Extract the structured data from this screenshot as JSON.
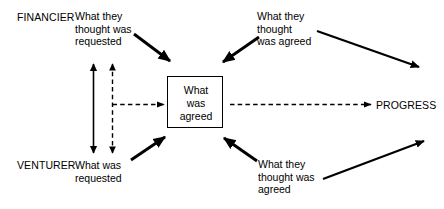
{
  "diagram": {
    "background_color": "#ffffff",
    "stroke_color": "#000000",
    "width": 444,
    "height": 209,
    "roles": {
      "top": "FINANCIER",
      "bottom": "VENTURER"
    },
    "labels": {
      "financier_requested": "What they\nthought was\nrequested",
      "financier_agreed": "What they\nthought\nwas agreed",
      "venturer_requested": "What was\nrequested",
      "venturer_agreed": "What they\nthought was\nagreed",
      "progress": "PROGRESS"
    },
    "center_box": {
      "text": "What\nwas\nagreed",
      "line1": "What",
      "line2": "was",
      "line3": "agreed"
    },
    "connectors": [
      {
        "name": "financier-requested-to-box",
        "style": "solid",
        "direction": "down-right",
        "from": "What they thought was requested",
        "to": "What was agreed"
      },
      {
        "name": "financier-agreed-from-box",
        "style": "solid",
        "direction": "down-left",
        "from": "What they thought was agreed",
        "to": "What was agreed"
      },
      {
        "name": "financier-agreed-to-progress",
        "style": "solid",
        "direction": "down-right",
        "from": "What they thought was agreed",
        "to": "PROGRESS"
      },
      {
        "name": "venturer-requested-to-box",
        "style": "solid",
        "direction": "up-right",
        "from": "What was requested",
        "to": "What was agreed"
      },
      {
        "name": "venturer-agreed-from-box",
        "style": "solid",
        "direction": "up-left",
        "from": "What they thought was agreed",
        "to": "What was agreed"
      },
      {
        "name": "venturer-agreed-to-progress",
        "style": "solid",
        "direction": "up-right",
        "from": "What they thought was agreed",
        "to": "PROGRESS"
      },
      {
        "name": "gap-solid-vertical",
        "style": "solid",
        "direction": "double-headed vertical",
        "from": "FINANCIER side",
        "to": "VENTURER side"
      },
      {
        "name": "gap-dashed-vertical",
        "style": "dashed",
        "direction": "double-headed vertical",
        "from": "FINANCIER side",
        "to": "VENTURER side"
      },
      {
        "name": "gap-dashed-to-box",
        "style": "dashed",
        "direction": "right",
        "from": "gap",
        "to": "What was agreed"
      },
      {
        "name": "box-to-progress",
        "style": "dashed",
        "direction": "right",
        "from": "What was agreed",
        "to": "PROGRESS"
      }
    ]
  }
}
